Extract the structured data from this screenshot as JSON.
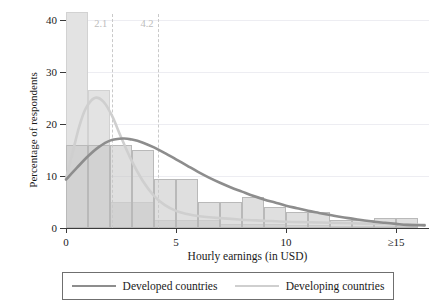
{
  "chart_data": {
    "type": "bar",
    "title": "",
    "xlabel": "Hourly earnings (in USD)",
    "ylabel": "Percentage of respondents",
    "xlim": [
      0,
      16.5
    ],
    "ylim": [
      0,
      42
    ],
    "xticks": [
      0,
      5,
      10,
      15
    ],
    "xticklabels": [
      "0",
      "5",
      "10",
      "≥15"
    ],
    "yticks": [
      0,
      10,
      20,
      30,
      40
    ],
    "yticklabels": [
      "0",
      "10",
      "20",
      "30",
      "40"
    ],
    "grid": "horizontal",
    "legend_position": "below-axis",
    "bin_width": 1,
    "bin_starts": [
      0,
      1,
      2,
      3,
      4,
      5,
      6,
      7,
      8,
      9,
      10,
      11,
      12,
      13,
      14,
      15
    ],
    "series": [
      {
        "name": "Developing countries",
        "color": "#cfcfcf",
        "bar_values": [
          41.5,
          26.5,
          5.0,
          5.0,
          1.6,
          1.6,
          1.6,
          0.8,
          0.8,
          0.8,
          0.6,
          0.6,
          0.4,
          0.4,
          0.3,
          0.3
        ],
        "curve_peak_x": 1.3,
        "curve_peak_y": 25.0,
        "curve": [
          [
            0.0,
            9.5
          ],
          [
            0.3,
            14.5
          ],
          [
            0.6,
            19.5
          ],
          [
            0.9,
            23.0
          ],
          [
            1.3,
            25.0
          ],
          [
            1.7,
            24.3
          ],
          [
            2.1,
            21.5
          ],
          [
            2.5,
            17.5
          ],
          [
            3.0,
            12.8
          ],
          [
            3.5,
            9.0
          ],
          [
            4.0,
            6.2
          ],
          [
            4.5,
            4.4
          ],
          [
            5.0,
            3.3
          ],
          [
            5.5,
            2.7
          ],
          [
            6.0,
            2.3
          ],
          [
            7.0,
            1.9
          ],
          [
            8.0,
            1.6
          ],
          [
            9.0,
            1.4
          ],
          [
            10.0,
            1.2
          ],
          [
            11.0,
            1.1
          ],
          [
            12.0,
            1.0
          ],
          [
            13.0,
            0.9
          ],
          [
            14.0,
            0.8
          ],
          [
            15.0,
            0.7
          ],
          [
            16.3,
            0.6
          ]
        ]
      },
      {
        "name": "Developed countries",
        "color": "#8d8d8d",
        "bar_values": [
          16.0,
          16.0,
          16.0,
          15.0,
          9.5,
          9.5,
          5.0,
          5.0,
          6.0,
          4.0,
          3.0,
          3.0,
          1.5,
          1.5,
          2.0,
          2.0
        ],
        "curve_peak_x": 2.6,
        "curve_peak_y": 17.2,
        "curve": [
          [
            0.0,
            9.3
          ],
          [
            0.5,
            11.6
          ],
          [
            1.0,
            13.8
          ],
          [
            1.5,
            15.6
          ],
          [
            2.0,
            16.8
          ],
          [
            2.6,
            17.2
          ],
          [
            3.0,
            17.0
          ],
          [
            3.5,
            16.4
          ],
          [
            4.0,
            15.5
          ],
          [
            4.5,
            14.4
          ],
          [
            5.0,
            13.2
          ],
          [
            5.5,
            12.0
          ],
          [
            6.0,
            10.8
          ],
          [
            6.5,
            9.7
          ],
          [
            7.0,
            8.7
          ],
          [
            7.5,
            7.8
          ],
          [
            8.0,
            7.0
          ],
          [
            8.5,
            6.2
          ],
          [
            9.0,
            5.5
          ],
          [
            9.5,
            4.9
          ],
          [
            10.0,
            4.3
          ],
          [
            10.5,
            3.8
          ],
          [
            11.0,
            3.3
          ],
          [
            11.5,
            2.9
          ],
          [
            12.0,
            2.5
          ],
          [
            12.5,
            2.1
          ],
          [
            13.0,
            1.8
          ],
          [
            13.5,
            1.5
          ],
          [
            14.0,
            1.2
          ],
          [
            14.5,
            1.0
          ],
          [
            15.0,
            0.8
          ],
          [
            15.5,
            0.6
          ],
          [
            16.3,
            0.5
          ]
        ]
      }
    ],
    "reference_lines": [
      {
        "label": "2.1",
        "x": 2.1
      },
      {
        "label": "4.2",
        "x": 4.2
      }
    ]
  },
  "legend": {
    "entries": [
      {
        "label": "Developed countries"
      },
      {
        "label": "Developing countries"
      }
    ]
  }
}
